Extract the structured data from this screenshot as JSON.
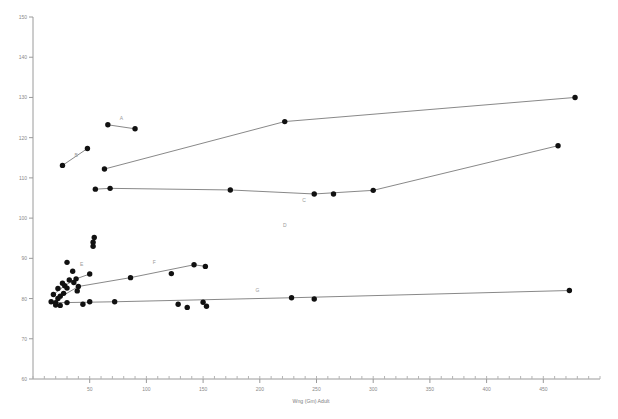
{
  "chart_data": {
    "type": "scatter",
    "title": "",
    "subtitle": "",
    "xlabel": "Wng (Gm) Adult",
    "ylabel": "",
    "xlim": [
      0,
      500
    ],
    "ylim": [
      60,
      150
    ],
    "grid": false,
    "legend_position": "inline-labels",
    "x_ticks": [
      50,
      100,
      150,
      200,
      250,
      300,
      350,
      400,
      450
    ],
    "x_tick_labels": [
      "50",
      "100",
      "150",
      "200",
      "250",
      "300",
      "350",
      "400",
      "450"
    ],
    "x_minor_tick_step": 10,
    "y_ticks": [
      60,
      70,
      80,
      90,
      100,
      110,
      120,
      130,
      140,
      150
    ],
    "y_tick_labels": [
      "60",
      "70",
      "80",
      "90",
      "100",
      "110",
      "120",
      "130",
      "140",
      "150"
    ],
    "point_color": "#111111",
    "line_color": "#555555",
    "axis_color": "#9a9a9a",
    "label_color": "#8a8a8a",
    "series": [
      {
        "name": "A",
        "label": "A",
        "label_x": 78,
        "label_y": 124.5,
        "connected": true,
        "points": [
          {
            "x": 66,
            "y": 123.2
          },
          {
            "x": 90,
            "y": 122.2
          }
        ]
      },
      {
        "name": "B",
        "label": "B",
        "label_x": 38,
        "label_y": 115.2,
        "connected": true,
        "points": [
          {
            "x": 26,
            "y": 113.1
          },
          {
            "x": 48,
            "y": 117.3
          }
        ]
      },
      {
        "name": "C",
        "label": "C",
        "label_x": 239,
        "label_y": 104.0,
        "connected": true,
        "points": [
          {
            "x": 63,
            "y": 112.2
          },
          {
            "x": 222,
            "y": 124.0
          },
          {
            "x": 478,
            "y": 130.0
          }
        ]
      },
      {
        "name": "D",
        "label": "D",
        "label_x": 222,
        "label_y": 97.9,
        "connected": true,
        "points": [
          {
            "x": 55,
            "y": 107.2
          },
          {
            "x": 68,
            "y": 107.4
          },
          {
            "x": 174,
            "y": 107.0
          },
          {
            "x": 248,
            "y": 106.0
          },
          {
            "x": 300,
            "y": 106.9
          },
          {
            "x": 463,
            "y": 118.0
          }
        ]
      },
      {
        "name": "E",
        "label": "E",
        "label_x": 43,
        "label_y": 88.0,
        "connected": true,
        "points": [
          {
            "x": 18,
            "y": 81.0
          },
          {
            "x": 28,
            "y": 83.2
          },
          {
            "x": 38,
            "y": 84.9
          },
          {
            "x": 50,
            "y": 86.1
          }
        ]
      },
      {
        "name": "F",
        "label": "F",
        "label_x": 107,
        "label_y": 88.5,
        "connected": true,
        "points": [
          {
            "x": 22,
            "y": 80.0
          },
          {
            "x": 40,
            "y": 83.0
          },
          {
            "x": 86,
            "y": 85.2
          },
          {
            "x": 142,
            "y": 88.4
          },
          {
            "x": 152,
            "y": 88.0
          }
        ]
      },
      {
        "name": "G",
        "label": "G",
        "label_x": 198,
        "label_y": 81.6,
        "connected": true,
        "points": [
          {
            "x": 20,
            "y": 79.0
          },
          {
            "x": 30,
            "y": 79.0
          },
          {
            "x": 72,
            "y": 79.2
          },
          {
            "x": 228,
            "y": 80.2
          },
          {
            "x": 473,
            "y": 82.0
          }
        ]
      }
    ],
    "scatter_only_points": [
      {
        "x": 30,
        "y": 89.0
      },
      {
        "x": 35,
        "y": 86.8
      },
      {
        "x": 36,
        "y": 84.0
      },
      {
        "x": 39,
        "y": 81.9
      },
      {
        "x": 30,
        "y": 82.6
      },
      {
        "x": 27,
        "y": 81.3
      },
      {
        "x": 24,
        "y": 80.6
      },
      {
        "x": 22,
        "y": 82.5
      },
      {
        "x": 26,
        "y": 83.8
      },
      {
        "x": 32,
        "y": 84.6
      },
      {
        "x": 16,
        "y": 79.2
      },
      {
        "x": 20,
        "y": 78.4
      },
      {
        "x": 24,
        "y": 78.3
      },
      {
        "x": 44,
        "y": 78.6
      },
      {
        "x": 50,
        "y": 79.2
      },
      {
        "x": 54,
        "y": 95.2
      },
      {
        "x": 53,
        "y": 94.0
      },
      {
        "x": 53,
        "y": 93.0
      },
      {
        "x": 128,
        "y": 78.6
      },
      {
        "x": 136,
        "y": 77.8
      },
      {
        "x": 150,
        "y": 79.1
      },
      {
        "x": 153,
        "y": 78.1
      },
      {
        "x": 122,
        "y": 86.2
      },
      {
        "x": 248,
        "y": 79.9
      },
      {
        "x": 265,
        "y": 106.0
      }
    ],
    "point_radius_px": 2.7
  }
}
